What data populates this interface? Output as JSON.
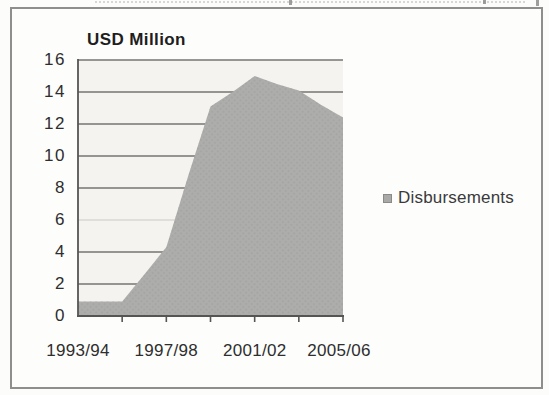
{
  "figure": {
    "title": "USD Million",
    "legend": {
      "label": "Disbursements",
      "swatch_color": "#a9a9a7"
    }
  },
  "colors": {
    "area_fill": "#adadab",
    "area_texture": "#9e9e9c",
    "plot_background": "#f5f3f0",
    "gridline": "#757573",
    "gridline_faint": "#c9c9c5",
    "axis": "#555553",
    "frame_border": "#8e8e8c",
    "text": "#2e2e2e"
  },
  "chart_data": {
    "type": "area",
    "title": "USD Million",
    "categories": [
      "1993/94",
      "1994/95",
      "1995/96",
      "1996/97",
      "1997/98",
      "1998/99",
      "1999/00",
      "2000/01",
      "2001/02",
      "2002/03",
      "2003/04",
      "2004/05",
      "2005/06"
    ],
    "series": [
      {
        "name": "Disbursements",
        "values": [
          0.9,
          0.9,
          0.9,
          2.6,
          4.3,
          8.8,
          13.1,
          14.0,
          15.0,
          14.5,
          14.1,
          13.2,
          12.4
        ]
      }
    ],
    "shown_x_tick_labels": [
      "1993/94",
      "1997/98",
      "2001/02",
      "2005/06"
    ],
    "xlabel": "",
    "ylabel": "USD Million",
    "ylim": [
      0,
      16
    ],
    "ytick_step": 2,
    "grid": true,
    "legend_position": "right"
  }
}
